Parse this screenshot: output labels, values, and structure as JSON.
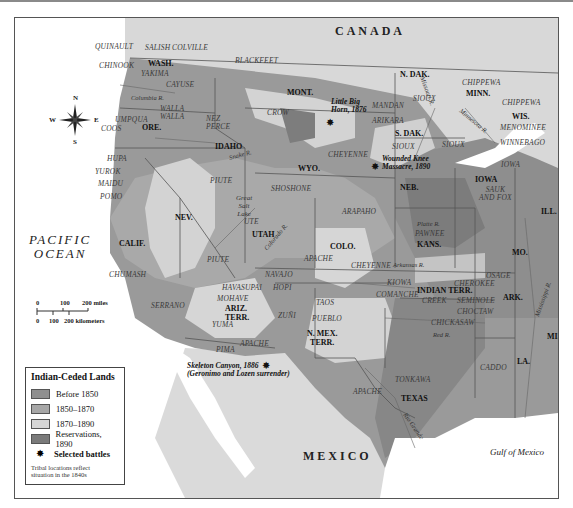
{
  "colors": {
    "before_1850": "#8f8f8f",
    "1850_1870": "#a7a7a7",
    "1870_1890": "#d6d6d6",
    "reservations_1890": "#7a7a7a",
    "water": "#ffffff",
    "foreign_land": "#dcdcdc"
  },
  "countries": {
    "canada": "CANADA",
    "mexico": "MEXICO"
  },
  "water_bodies": {
    "pacific_line1": "PACIFIC",
    "pacific_line2": "OCEAN",
    "gulf": "Gulf of Mexico"
  },
  "states": {
    "wash": "WASH.",
    "ore": "ORE.",
    "calif": "CALIF.",
    "idaho": "IDAHO",
    "nev": "NEV.",
    "utah": "UTAH",
    "mont": "MONT.",
    "wyo": "WYO.",
    "colo": "COLO.",
    "ariz_1": "ARIZ.",
    "ariz_2": "TERR.",
    "nmex_1": "N. MEX.",
    "nmex_2": "TERR.",
    "ndak": "N. DAK.",
    "sdak": "S. DAK.",
    "neb": "NEB.",
    "kans": "KANS.",
    "indian_terr": "INDIAN TERR.",
    "texas": "TEXAS",
    "minn": "MINN.",
    "wis": "WIS.",
    "iowa": "IOWA",
    "ill": "ILL.",
    "mo": "MO.",
    "ark": "ARK.",
    "la": "LA.",
    "miss": "MISS."
  },
  "tribes": {
    "quinault": "QUINAULT",
    "salish": "SALISH",
    "colville": "COLVILLE",
    "chinook": "CHINOOK",
    "yakima": "YAKIMA",
    "cayuse": "CAYUSE",
    "walla1": "WALLA",
    "walla2": "WALLA",
    "umpqua": "UMPQUA",
    "coos": "COOS",
    "hupa": "HUPA",
    "yurok": "YUROK",
    "maidu": "MAIDU",
    "pomo": "POMO",
    "chumash": "CHUMASH",
    "serrano": "SERRANO",
    "blackfeet": "BLACKFEET",
    "nez1": "NEZ",
    "nez2": "PERCE",
    "crow": "CROW",
    "piute_n": "PIUTE",
    "piute_s": "PIUTE",
    "shoshone": "SHOSHONE",
    "ute": "UTE",
    "cheyenne_n": "CHEYENNE",
    "cheyenne_s": "CHEYENNE",
    "arapaho": "ARAPAHO",
    "apache_n": "APACHE",
    "apache_az": "APACHE",
    "apache_tx": "APACHE",
    "navajo": "NAVAJO",
    "havasupai": "HAVASUPAI",
    "mohave": "MOHAVE",
    "hopi": "HOPI",
    "yuma": "YUMA",
    "pima": "PIMA",
    "zuni": "ZUÑI",
    "taos": "TAOS",
    "pueblo": "PUEBLO",
    "mandan": "MANDAN",
    "arikara": "ARIKARA",
    "sioux_n": "SIOUX",
    "sioux_c": "SIOUX",
    "sioux_e": "SIOUX",
    "pawnee": "PAWNEE",
    "kiowa": "KIOWA",
    "comanche": "COMANCHE",
    "osage": "OSAGE",
    "cherokee": "CHEROKEE",
    "creek": "CREEK",
    "seminole": "SEMINOLE",
    "choctaw": "CHOCTAW",
    "chickasaw": "CHICKASAW",
    "tonkawa": "TONKAWA",
    "caddo": "CADDO",
    "chippewa_mn": "CHIPPEWA",
    "chippewa_wi": "CHIPPEWA",
    "menominee": "MENOMINEE",
    "winnebago": "WINNEBAGO",
    "iowa_tribe": "IOWA",
    "sauk1": "SAUK",
    "sauk2": "AND FOX"
  },
  "rivers": {
    "columbia": "Columbia R.",
    "snake": "Snake R.",
    "colorado": "Colorado R.",
    "missouri": "Missouri R.",
    "minnesota": "Minnesota R.",
    "platte": "Platte R.",
    "arkansas": "Arkansas R.",
    "red": "Red R.",
    "rio_grande": "Rio Grande",
    "mississippi": "Mississippi R."
  },
  "places": {
    "great_salt_lake_1": "Great",
    "great_salt_lake_2": "Salt",
    "great_salt_lake_3": "Lake"
  },
  "battles": {
    "little_bighorn_1": "Little Big",
    "little_bighorn_2": "Horn, 1876",
    "wounded_knee_1": "Wounded Knee",
    "wounded_knee_2": "Massacre, 1890",
    "skeleton_canyon_1": "Skeleton Canyon, 1886",
    "skeleton_canyon_2": "(Geronimo and Lozen surrender)"
  },
  "compass": {
    "n": "N",
    "s": "S",
    "e": "E",
    "w": "W"
  },
  "scale": {
    "m0": "0",
    "m100": "100",
    "m200": "200 miles",
    "k0": "0",
    "k100": "100",
    "k200": "200 kilometers"
  },
  "legend": {
    "title": "Indian-Ceded Lands",
    "items": [
      {
        "label": "Before 1850",
        "color": "#8f8f8f"
      },
      {
        "label": "1850–1870",
        "color": "#a7a7a7"
      },
      {
        "label": "1870–1890",
        "color": "#d6d6d6"
      },
      {
        "label": "Reservations, 1890",
        "color": "#7a7a7a"
      }
    ],
    "battles_label": "Selected battles",
    "note_line1": "Tribal locations reflect",
    "note_line2": "situation in the 1840s"
  }
}
